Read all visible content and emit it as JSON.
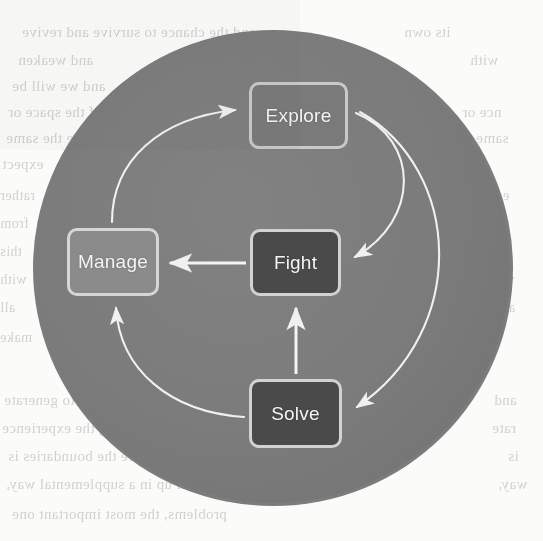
{
  "diagram": {
    "shape": "circle",
    "background_color": "#7c7c7c",
    "page_color": "#fbfbfa",
    "stroke_color": "#f0f0f0",
    "nodes": [
      {
        "id": "explore",
        "label": "Explore",
        "style": "mid",
        "fill": "#7a7a7a",
        "border": "#cfcfcf"
      },
      {
        "id": "fight",
        "label": "Fight",
        "style": "dark",
        "fill": "#4a4a4a",
        "border": "#d2d2d2"
      },
      {
        "id": "manage",
        "label": "Manage",
        "style": "light",
        "fill": "#8b8b8b",
        "border": "#d6d6d6"
      },
      {
        "id": "solve",
        "label": "Solve",
        "style": "dark",
        "fill": "#4a4a4a",
        "border": "#d2d2d2"
      }
    ],
    "edges": [
      {
        "id": "manage-to-explore",
        "from": "manage",
        "to": "explore",
        "kind": "curved",
        "direction": "clockwise"
      },
      {
        "id": "explore-to-fight",
        "from": "explore",
        "to": "fight",
        "kind": "curved",
        "direction": "clockwise"
      },
      {
        "id": "explore-to-solve",
        "from": "explore",
        "to": "solve",
        "kind": "curved",
        "direction": "clockwise"
      },
      {
        "id": "fight-to-manage",
        "from": "fight",
        "to": "manage",
        "kind": "straight",
        "direction": "left"
      },
      {
        "id": "solve-to-fight",
        "from": "solve",
        "to": "fight",
        "kind": "straight",
        "direction": "up"
      },
      {
        "id": "solve-to-manage",
        "from": "solve",
        "to": "manage",
        "kind": "curved",
        "direction": "clockwise"
      }
    ]
  },
  "bleed_text": {
    "note": "faint show-through of printed text from the reverse of the scanned page",
    "lines": [
      {
        "text": "and the chance to survive and revive",
        "x": 22,
        "y": 24,
        "size": 15
      },
      {
        "text": "and weaken",
        "x": 18,
        "y": 52,
        "size": 15
      },
      {
        "text": "and we will be",
        "x": 12,
        "y": 78,
        "size": 15
      },
      {
        "text": "the importance of the space or",
        "x": 8,
        "y": 104,
        "size": 15
      },
      {
        "text": "will not be the same",
        "x": 6,
        "y": 130,
        "size": 15
      },
      {
        "text": "expect",
        "x": 2,
        "y": 156,
        "size": 15
      },
      {
        "text": "rather",
        "x": 0,
        "y": 188,
        "size": 14
      },
      {
        "text": "from",
        "x": 0,
        "y": 216,
        "size": 14
      },
      {
        "text": "this",
        "x": 0,
        "y": 244,
        "size": 14
      },
      {
        "text": "with",
        "x": 0,
        "y": 272,
        "size": 14
      },
      {
        "text": "all",
        "x": 0,
        "y": 300,
        "size": 14
      },
      {
        "text": "make",
        "x": 0,
        "y": 330,
        "size": 14
      },
      {
        "text": "more and more likely to generate",
        "x": 4,
        "y": 392,
        "size": 15
      },
      {
        "text": "manner, which means during the experience",
        "x": 2,
        "y": 420,
        "size": 15
      },
      {
        "text": "a problem where the boundaries is",
        "x": 8,
        "y": 448,
        "size": 15
      },
      {
        "text": "ever, level up in a supplemental way,",
        "x": 6,
        "y": 476,
        "size": 15
      },
      {
        "text": "problems, the most important one",
        "x": 12,
        "y": 506,
        "size": 15
      },
      {
        "text": "its own",
        "x": 404,
        "y": 24,
        "size": 15
      },
      {
        "text": "with",
        "x": 470,
        "y": 52,
        "size": 15
      },
      {
        "text": "nce or",
        "x": 462,
        "y": 104,
        "size": 15
      },
      {
        "text": "same",
        "x": 476,
        "y": 130,
        "size": 15
      },
      {
        "text": "each",
        "x": 482,
        "y": 188,
        "size": 14
      },
      {
        "text": "that",
        "x": 486,
        "y": 216,
        "size": 14
      },
      {
        "text": "from",
        "x": 484,
        "y": 244,
        "size": 14
      },
      {
        "text": "with",
        "x": 488,
        "y": 272,
        "size": 14
      },
      {
        "text": "all",
        "x": 500,
        "y": 300,
        "size": 14
      },
      {
        "text": "and",
        "x": 494,
        "y": 392,
        "size": 15
      },
      {
        "text": "rate",
        "x": 492,
        "y": 420,
        "size": 15
      },
      {
        "text": "is",
        "x": 508,
        "y": 448,
        "size": 15
      },
      {
        "text": "way,",
        "x": 498,
        "y": 476,
        "size": 15
      }
    ]
  }
}
